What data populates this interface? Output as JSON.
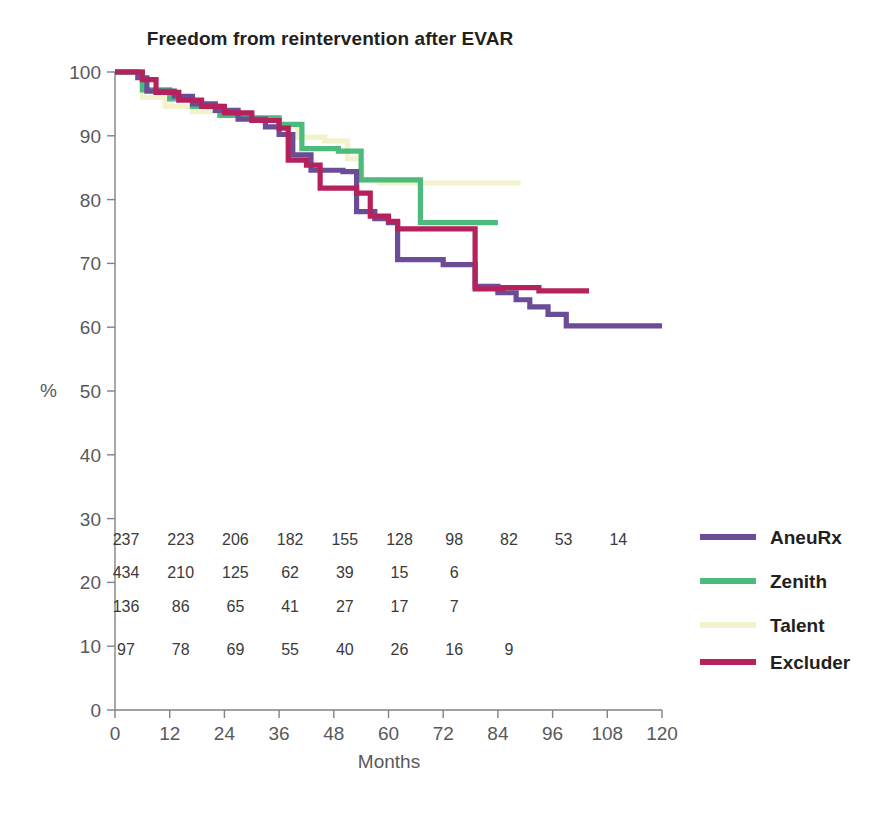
{
  "chart_data": {
    "type": "line",
    "subtype": "kaplan-meier-step",
    "title": "Freedom from reintervention after EVAR",
    "xlabel": "Months",
    "ylabel": "%",
    "xlim": [
      0,
      120
    ],
    "ylim": [
      0,
      100
    ],
    "xticks": [
      0,
      12,
      24,
      36,
      48,
      60,
      72,
      84,
      96,
      108,
      120
    ],
    "yticks": [
      0,
      10,
      20,
      30,
      40,
      50,
      60,
      70,
      80,
      90,
      100
    ],
    "grid": false,
    "legend_position": "right",
    "series": [
      {
        "name": "AneuRx",
        "color": "#6B4C96",
        "steps": [
          [
            0,
            100.0
          ],
          [
            5,
            99.1
          ],
          [
            7,
            97.0
          ],
          [
            13,
            96.2
          ],
          [
            17,
            95.0
          ],
          [
            22,
            94.0
          ],
          [
            27,
            92.6
          ],
          [
            33,
            91.4
          ],
          [
            36,
            90.2
          ],
          [
            39,
            87.0
          ],
          [
            43,
            84.6
          ],
          [
            50,
            84.4
          ],
          [
            53,
            78.1
          ],
          [
            57,
            77.0
          ],
          [
            60,
            76.4
          ],
          [
            62,
            70.6
          ],
          [
            72,
            69.8
          ],
          [
            79,
            66.4
          ],
          [
            84,
            65.4
          ],
          [
            88,
            64.3
          ],
          [
            91,
            63.2
          ],
          [
            95,
            62.0
          ],
          [
            99,
            60.2
          ],
          [
            120,
            60.2
          ]
        ]
      },
      {
        "name": "Zenith",
        "color": "#4CBB7B",
        "steps": [
          [
            0,
            100.0
          ],
          [
            6,
            97.2
          ],
          [
            12,
            95.8
          ],
          [
            17,
            94.6
          ],
          [
            23,
            93.2
          ],
          [
            30,
            92.8
          ],
          [
            36,
            91.8
          ],
          [
            41,
            88.0
          ],
          [
            49,
            87.6
          ],
          [
            54,
            83.1
          ],
          [
            67,
            83.1
          ],
          [
            67,
            76.4
          ],
          [
            84,
            76.4
          ]
        ]
      },
      {
        "name": "Talent",
        "color": "#F2F2CC",
        "steps": [
          [
            0,
            100.0
          ],
          [
            6,
            96.0
          ],
          [
            11,
            94.6
          ],
          [
            17,
            93.8
          ],
          [
            23,
            93.4
          ],
          [
            29,
            92.6
          ],
          [
            36,
            91.5
          ],
          [
            40,
            89.8
          ],
          [
            46,
            89.2
          ],
          [
            51,
            86.4
          ],
          [
            54,
            83.1
          ],
          [
            58,
            82.6
          ],
          [
            89,
            82.6
          ]
        ]
      },
      {
        "name": "Excluder",
        "color": "#B5215C",
        "steps": [
          [
            0,
            100.0
          ],
          [
            6,
            98.8
          ],
          [
            9,
            96.8
          ],
          [
            14,
            95.6
          ],
          [
            19,
            94.6
          ],
          [
            24,
            93.6
          ],
          [
            30,
            92.4
          ],
          [
            36,
            91.2
          ],
          [
            38,
            86.2
          ],
          [
            42,
            85.4
          ],
          [
            45,
            81.8
          ],
          [
            53,
            81.0
          ],
          [
            56,
            77.4
          ],
          [
            60,
            76.6
          ],
          [
            62,
            75.4
          ],
          [
            66,
            75.4
          ],
          [
            72,
            75.4
          ],
          [
            79,
            75.4
          ],
          [
            79,
            66.0
          ],
          [
            85,
            66.2
          ],
          [
            93,
            65.7
          ],
          [
            104,
            65.7
          ]
        ]
      }
    ],
    "at_risk_table": {
      "times": [
        0,
        12,
        24,
        36,
        48,
        60,
        72,
        84,
        96,
        108
      ],
      "rows": [
        {
          "series": "AneuRx",
          "counts": [
            "237",
            "223",
            "206",
            "182",
            "155",
            "128",
            "98",
            "82",
            "53",
            "14"
          ]
        },
        {
          "series": "Zenith",
          "counts": [
            "434",
            "210",
            "125",
            "62",
            "39",
            "15",
            "6"
          ]
        },
        {
          "series": "Talent",
          "counts": [
            "136",
            "86",
            "65",
            "41",
            "27",
            "17",
            "7"
          ]
        },
        {
          "series": "Excluder",
          "counts": [
            "97",
            "78",
            "69",
            "55",
            "40",
            "26",
            "16",
            "9"
          ]
        }
      ]
    },
    "legend": [
      {
        "label": "AneuRx",
        "color": "#6B4C96"
      },
      {
        "label": "Zenith",
        "color": "#4CBB7B"
      },
      {
        "label": "Talent",
        "color": "#F2F2CC"
      },
      {
        "label": "Excluder",
        "color": "#B5215C"
      }
    ]
  }
}
